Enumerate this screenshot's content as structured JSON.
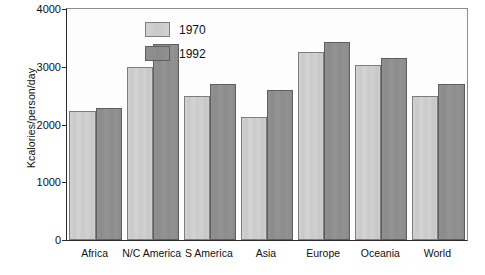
{
  "chart_data": {
    "type": "bar",
    "title": "",
    "xlabel": "",
    "ylabel": "Kcalories/person/day",
    "ylim": [
      0,
      4000
    ],
    "yticks": [
      0,
      1000,
      2000,
      3000,
      4000
    ],
    "ytick_labels": [
      "0",
      "1000",
      "2000",
      "3000",
      "4000"
    ],
    "grid": false,
    "legend_position": "top-left",
    "categories": [
      "Africa",
      "N/C America",
      "S America",
      "Asia",
      "Europe",
      "Oceania",
      "World"
    ],
    "series": [
      {
        "name": "1970",
        "color": "#cdcdcd",
        "values": [
          2230,
          3000,
          2500,
          2130,
          3250,
          3030,
          2490
        ]
      },
      {
        "name": "1992",
        "color": "#8f8f8f",
        "values": [
          2280,
          3390,
          2700,
          2590,
          3430,
          3150,
          2710
        ]
      }
    ]
  },
  "legend": {
    "items": [
      {
        "label": "1970"
      },
      {
        "label": "1992"
      }
    ]
  }
}
